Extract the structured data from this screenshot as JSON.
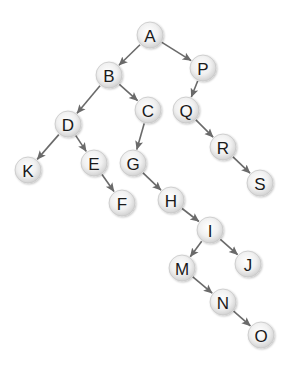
{
  "diagram": {
    "type": "binary-tree",
    "node_style": {
      "radius": 13,
      "fill_center": "#ffffff",
      "fill_edge": "#d6d6d6",
      "stroke": "#c8c8c8",
      "label_color": "#1a1a1a",
      "edge_color": "#6a6a6a"
    },
    "nodes": [
      {
        "id": "A",
        "label": "A",
        "x": 150,
        "y": 35
      },
      {
        "id": "B",
        "label": "B",
        "x": 109,
        "y": 75
      },
      {
        "id": "P",
        "label": "P",
        "x": 203,
        "y": 68
      },
      {
        "id": "C",
        "label": "C",
        "x": 148,
        "y": 110
      },
      {
        "id": "D",
        "label": "D",
        "x": 68,
        "y": 124
      },
      {
        "id": "Q",
        "label": "Q",
        "x": 186,
        "y": 110
      },
      {
        "id": "K",
        "label": "K",
        "x": 28,
        "y": 170
      },
      {
        "id": "E",
        "label": "E",
        "x": 94,
        "y": 163
      },
      {
        "id": "G",
        "label": "G",
        "x": 133,
        "y": 163
      },
      {
        "id": "R",
        "label": "R",
        "x": 223,
        "y": 147
      },
      {
        "id": "F",
        "label": "F",
        "x": 122,
        "y": 203
      },
      {
        "id": "H",
        "label": "H",
        "x": 171,
        "y": 200
      },
      {
        "id": "S",
        "label": "S",
        "x": 260,
        "y": 183
      },
      {
        "id": "I",
        "label": "I",
        "x": 210,
        "y": 230
      },
      {
        "id": "M",
        "label": "M",
        "x": 182,
        "y": 268
      },
      {
        "id": "J",
        "label": "J",
        "x": 248,
        "y": 264
      },
      {
        "id": "N",
        "label": "N",
        "x": 223,
        "y": 302
      },
      {
        "id": "O",
        "label": "O",
        "x": 261,
        "y": 335
      }
    ],
    "edges": [
      {
        "from": "A",
        "to": "B"
      },
      {
        "from": "A",
        "to": "P"
      },
      {
        "from": "B",
        "to": "D"
      },
      {
        "from": "B",
        "to": "C"
      },
      {
        "from": "P",
        "to": "Q"
      },
      {
        "from": "D",
        "to": "K"
      },
      {
        "from": "D",
        "to": "E"
      },
      {
        "from": "E",
        "to": "F"
      },
      {
        "from": "C",
        "to": "G"
      },
      {
        "from": "G",
        "to": "H"
      },
      {
        "from": "H",
        "to": "I"
      },
      {
        "from": "I",
        "to": "M"
      },
      {
        "from": "I",
        "to": "J"
      },
      {
        "from": "M",
        "to": "N"
      },
      {
        "from": "N",
        "to": "O"
      },
      {
        "from": "Q",
        "to": "R"
      },
      {
        "from": "R",
        "to": "S"
      }
    ]
  }
}
